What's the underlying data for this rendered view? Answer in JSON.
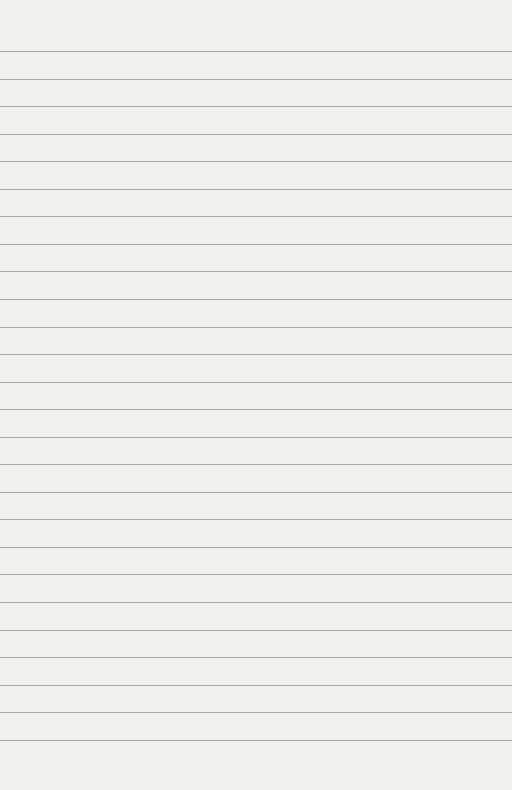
{
  "paper": {
    "type": "lined-paper",
    "background_color": "#f0f0ef",
    "line_color": "#8f8f8f",
    "first_line_y": 51,
    "line_spacing": 27.55,
    "line_count": 26
  }
}
